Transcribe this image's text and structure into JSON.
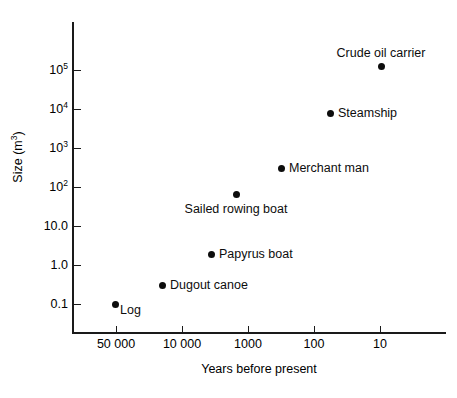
{
  "chart_data": {
    "type": "scatter",
    "title": "",
    "xlabel": "Years before present",
    "ylabel": "Size (m³)",
    "ylabel_base": "Size (m",
    "ylabel_sup": "3",
    "ylabel_tail": ")",
    "x_axis": {
      "scale": "log",
      "reversed": true,
      "tick_labels": [
        "50 000",
        "10 000",
        "1000",
        "100",
        "10"
      ],
      "tick_values": [
        50000,
        10000,
        1000,
        100,
        10
      ],
      "tick_px": [
        116,
        182,
        248,
        314,
        380
      ]
    },
    "y_axis": {
      "scale": "log",
      "tick_labels": [
        "10⁵",
        "10⁴",
        "10³",
        "10²",
        "10.0",
        "1.0",
        "0.1"
      ],
      "tick_mantissa": [
        "10",
        "10",
        "10",
        "10",
        "10.0",
        "1.0",
        "0.1"
      ],
      "tick_exponent": [
        "5",
        "4",
        "3",
        "2",
        "",
        "",
        ""
      ],
      "tick_values": [
        100000,
        10000,
        1000,
        100,
        10,
        1,
        0.1
      ],
      "tick_px": [
        70,
        109,
        148,
        187,
        226,
        265,
        304
      ]
    },
    "grid": false,
    "legend": "none",
    "points": [
      {
        "name": "Log",
        "x_years": 50000,
        "y_size": 0.1,
        "px": 115,
        "py": 304,
        "label": "Log",
        "label_pos": "below-right",
        "label_px": 120,
        "label_py": 310
      },
      {
        "name": "Dugout canoe",
        "x_years": 20000,
        "y_size": 0.3,
        "px": 162,
        "py": 285,
        "label": "Dugout canoe",
        "label_pos": "right",
        "label_px": 170,
        "label_py": 285
      },
      {
        "name": "Papyrus boat",
        "x_years": 3000,
        "y_size": 1.8,
        "px": 211,
        "py": 254,
        "label": "Papyrus boat",
        "label_pos": "right",
        "label_px": 219,
        "label_py": 254
      },
      {
        "name": "Sailed rowing boat",
        "x_years": 1300,
        "y_size": 80,
        "px": 236,
        "py": 194,
        "label": "Sailed rowing boat",
        "label_pos": "below",
        "label_px": 236,
        "label_py": 202
      },
      {
        "name": "Merchant man",
        "x_years": 280,
        "y_size": 300,
        "px": 281,
        "py": 168,
        "label": "Merchant man",
        "label_pos": "right",
        "label_px": 289,
        "label_py": 168
      },
      {
        "name": "Steamship",
        "x_years": 50,
        "y_size": 11000,
        "px": 330,
        "py": 113,
        "label": "Steamship",
        "label_pos": "right",
        "label_px": 338,
        "label_py": 113
      },
      {
        "name": "Crude oil carrier",
        "x_years": 17,
        "y_size": 180000,
        "px": 381,
        "py": 66,
        "label": "Crude oil carrier",
        "label_pos": "above",
        "label_px": 381,
        "label_py": 60
      }
    ],
    "colors": {
      "marker": "#0d0d0d",
      "axis": "#1a1a1a",
      "text": "#000000",
      "background": "#ffffff"
    }
  }
}
